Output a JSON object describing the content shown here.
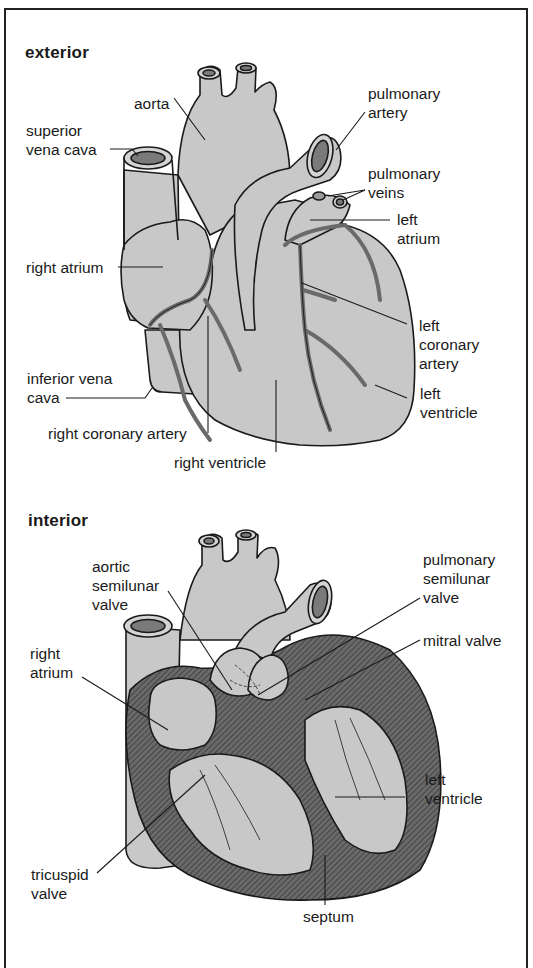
{
  "figure": {
    "colors": {
      "tissue": "#c8c8c8",
      "vessel_lumen": "#7a7a7a",
      "coronary": "#8a8a8a",
      "wall_hatch": "#555555",
      "outline": "#1a1a1a",
      "background": "#ffffff"
    }
  },
  "exterior": {
    "title": "exterior",
    "labels": {
      "aorta": "aorta",
      "superior_vena_cava": "superior\nvena cava",
      "pulmonary_artery": "pulmonary\nartery",
      "pulmonary_veins": "pulmonary\nveins",
      "left_atrium": "left\natrium",
      "right_atrium": "right atrium",
      "left_coronary_artery": "left\ncoronary\nartery",
      "inferior_vena_cava": "inferior vena\ncava",
      "left_ventricle": "left\nventricle",
      "right_coronary_artery": "right coronary artery",
      "right_ventricle": "right ventricle"
    }
  },
  "interior": {
    "title": "interior",
    "labels": {
      "aortic_semilunar_valve": "aortic\nsemilunar\nvalve",
      "pulmonary_semilunar_valve": "pulmonary\nsemilunar\nvalve",
      "mitral_valve": "mitral valve",
      "right_atrium": "right\natrium",
      "left_ventricle": "left\nventricle",
      "tricuspid_valve": "tricuspid\nvalve",
      "septum": "septum"
    }
  }
}
